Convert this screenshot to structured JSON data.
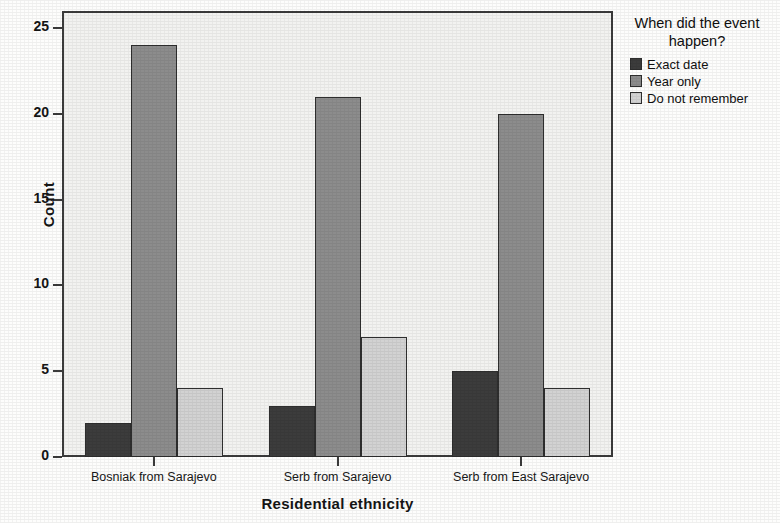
{
  "chart_data": {
    "type": "bar",
    "title": "",
    "xlabel": "Residential ethnicity",
    "ylabel": "Count",
    "categories": [
      "Bosniak from Sarajevo",
      "Serb from Sarajevo",
      "Serb from East Sarajevo"
    ],
    "series": [
      {
        "name": "Exact date",
        "color": "#3c3c3c",
        "values": [
          2,
          3,
          5
        ]
      },
      {
        "name": "Year only",
        "color": "#8c8c8c",
        "values": [
          24,
          21,
          20
        ]
      },
      {
        "name": "Do not remember",
        "color": "#d2d2d2",
        "values": [
          4,
          7,
          4
        ]
      }
    ],
    "ylim": [
      0,
      26
    ],
    "yticks": [
      0,
      5,
      10,
      15,
      20,
      25
    ],
    "ytick_labels": [
      "0",
      "5",
      "10",
      "15",
      "20",
      "25"
    ],
    "grid": false,
    "legend_position": "right",
    "legend_title": "When did the event happen?",
    "legend_title_line1": "When did the event",
    "legend_title_line2": "happen?",
    "plot_background": "#f2f2f0",
    "axis_color": "#3b3b3b"
  }
}
